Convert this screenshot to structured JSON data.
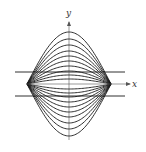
{
  "figure": {
    "width": 146,
    "height": 152,
    "background": "#ffffff",
    "stroke_color": "#1a1a1a",
    "axes": {
      "x_label": "x",
      "y_label": "y",
      "origin": [
        69,
        84
      ],
      "x_axis": {
        "x_start": 27,
        "x_end": 130,
        "y": 84
      },
      "y_axis": {
        "x": 69,
        "y_start": 140,
        "y_end": 22
      },
      "x_label_pos": [
        132,
        87
      ],
      "y_label_pos": [
        66,
        16
      ]
    },
    "horizontal_lines": [
      {
        "name": "upper-line",
        "y": 72,
        "x_start": 15,
        "x_end": 125
      },
      {
        "name": "lower-line",
        "y": 96,
        "x_start": 15,
        "x_end": 125
      }
    ],
    "curve_family": {
      "description": "family of sine-like arcs y = c*sin(pi*(x-a)/(b-a)) through two fixed points",
      "left_x": 27,
      "right_x": 111,
      "baseline_y": 84,
      "amplitudes": [
        52,
        45,
        39,
        33,
        28,
        23,
        18,
        13,
        9,
        5,
        -5,
        -9,
        -13,
        -18,
        -23,
        -28,
        -33,
        -39,
        -45,
        -52
      ]
    }
  }
}
